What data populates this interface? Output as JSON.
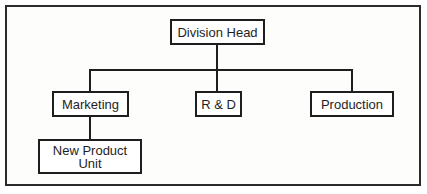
{
  "diagram": {
    "type": "org-chart",
    "nodes": {
      "head": {
        "label": "Division Head"
      },
      "marketing": {
        "label": "Marketing"
      },
      "rnd": {
        "label": "R & D"
      },
      "production": {
        "label": "Production"
      },
      "new_product": {
        "line1": "New Product",
        "line2": "Unit"
      }
    },
    "edges": [
      [
        "Division Head",
        "Marketing"
      ],
      [
        "Division Head",
        "R & D"
      ],
      [
        "Division Head",
        "Production"
      ],
      [
        "Marketing",
        "New Product Unit"
      ]
    ],
    "colors": {
      "line": "#1e1e1e",
      "background": "#ffffff"
    }
  }
}
